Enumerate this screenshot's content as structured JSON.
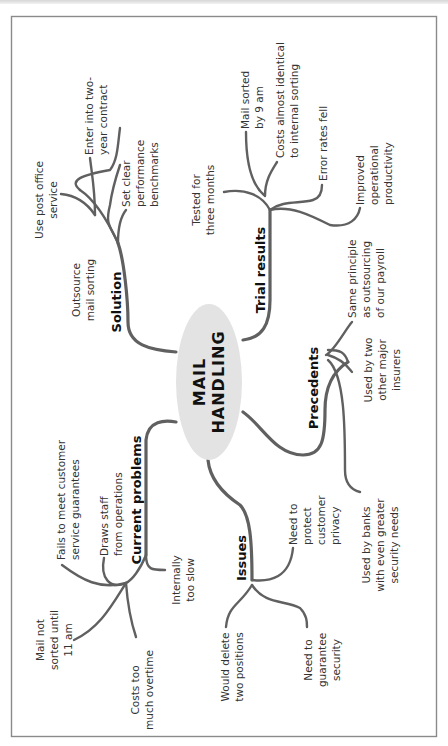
{
  "diagram": {
    "type": "mind-map",
    "orientation": "rotated-90-ccw",
    "colors": {
      "ellipse_fill": "#e3e3e3",
      "line": "#606060",
      "frame": "#8a8a8a",
      "text": "#333333"
    },
    "center": {
      "line1": "MAIL",
      "line2": "HANDLING"
    },
    "branches": {
      "solution": {
        "label": "Solution",
        "leaves": [
          {
            "lines": [
              "Outsource",
              "mail sorting"
            ]
          },
          {
            "lines": [
              "Use post office",
              "service"
            ]
          },
          {
            "lines": [
              "Enter into two-",
              "year contract"
            ]
          },
          {
            "lines": [
              "Set clear",
              "performance",
              "benchmarks"
            ]
          }
        ]
      },
      "trial_results": {
        "label": "Trial results",
        "leaves": [
          {
            "lines": [
              "Tested for",
              "three months"
            ]
          },
          {
            "lines": [
              "Mail sorted",
              "by 9 am"
            ]
          },
          {
            "lines": [
              "Costs almost identical",
              "to internal sorting"
            ]
          },
          {
            "lines": [
              "Error rates fell"
            ]
          },
          {
            "lines": [
              "Improved",
              "operational",
              "productivity"
            ]
          }
        ]
      },
      "precedents": {
        "label": "Precedents",
        "leaves": [
          {
            "lines": [
              "Same principle",
              "as outsourcing",
              "of our payroll"
            ]
          },
          {
            "lines": [
              "Used by two",
              "other major",
              "insurers"
            ]
          },
          {
            "lines": [
              "Used by banks",
              "with even greater",
              "security needs"
            ]
          }
        ]
      },
      "issues": {
        "label": "Issues",
        "leaves": [
          {
            "lines": [
              "Need to",
              "protect",
              "customer",
              "privacy"
            ]
          },
          {
            "lines": [
              "Need to",
              "guarantee",
              "security"
            ]
          },
          {
            "lines": [
              "Would delete",
              "two positions"
            ]
          }
        ]
      },
      "current_problems": {
        "label": "Current problems",
        "leaves": [
          {
            "lines": [
              "Fails to meet customer",
              "service guarantees"
            ]
          },
          {
            "lines": [
              "Draws staff",
              "from operations"
            ]
          },
          {
            "lines": [
              "Internally",
              "too slow"
            ]
          },
          {
            "lines": [
              "Mail not",
              "sorted until",
              "11 am"
            ]
          },
          {
            "lines": [
              "Costs too",
              "much overtime"
            ]
          }
        ]
      }
    }
  }
}
